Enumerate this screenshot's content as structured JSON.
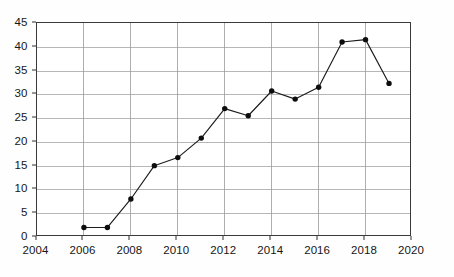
{
  "chart_data": {
    "type": "line",
    "title": "",
    "subtitle": "",
    "xlabel": "",
    "ylabel": "",
    "x": [
      2006,
      2007,
      2008,
      2009,
      2010,
      2011,
      2012,
      2013,
      2014,
      2015,
      2016,
      2017,
      2018,
      2019
    ],
    "values": [
      2,
      2,
      8,
      15,
      16.7,
      20.8,
      27,
      25.5,
      30.7,
      29,
      31.5,
      41,
      41.5,
      32.3
    ],
    "series": [
      {
        "name": "",
        "values": [
          2,
          2,
          8,
          15,
          16.7,
          20.8,
          27,
          25.5,
          30.7,
          29,
          31.5,
          41,
          41.5,
          32.3
        ]
      }
    ],
    "xlim": [
      2004,
      2020
    ],
    "ylim": [
      0,
      45
    ],
    "ytick_values": [
      0,
      5,
      10,
      15,
      20,
      25,
      30,
      35,
      40,
      45
    ],
    "ytick_labels": [
      "0",
      "5",
      "10",
      "15",
      "20",
      "25",
      "30",
      "35",
      "40",
      "45"
    ],
    "xtick_values": [
      2004,
      2006,
      2008,
      2010,
      2012,
      2014,
      2016,
      2018,
      2020
    ],
    "xtick_labels": [
      "2004",
      "2006",
      "2008",
      "2010",
      "2012",
      "2014",
      "2016",
      "2018",
      "2020"
    ],
    "grid": {
      "horizontal": true,
      "vertical": true,
      "color": "#9a9a9a"
    },
    "legend": {
      "visible": false,
      "position": "none",
      "entries": []
    },
    "annotations": [],
    "style": {
      "line_color": "#1c1c1c",
      "marker_color": "#0d0d0d",
      "marker_shape": "circle",
      "background": "#ffffff",
      "frame_color": "#3a3a3a"
    }
  }
}
